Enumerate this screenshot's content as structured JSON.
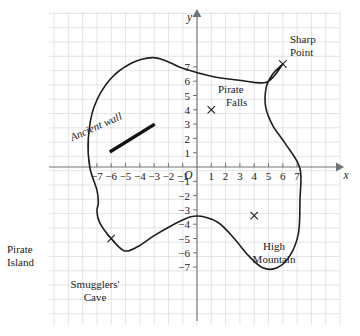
{
  "figure": {
    "kind": "coordinate-grid-map",
    "background_color": "#ffffff",
    "grid_color": "#d9dde2",
    "axis_color": "#6f7276",
    "ink_color": "#1d1d1d"
  },
  "axes": {
    "x_axis_label": "x",
    "y_axis_label": "y",
    "origin_label": "O",
    "x_ticks": [
      "−7",
      "−6",
      "−5",
      "−4",
      "−3",
      "−2",
      "−1",
      "1",
      "2",
      "3",
      "4",
      "5",
      "6",
      "7"
    ],
    "y_ticks": [
      "7",
      "6",
      "5",
      "4",
      "3",
      "2",
      "1",
      "−1",
      "−2",
      "−3",
      "−4",
      "−5",
      "−6",
      "−7"
    ],
    "x_range": [
      -8,
      8
    ],
    "y_range": [
      -8,
      8
    ],
    "grid_visible": true
  },
  "labels": {
    "island": {
      "line1": "Pirate",
      "line2": "Island"
    },
    "sharp_point": {
      "line1": "Sharp",
      "line2": "Point",
      "marker_coords": [
        6,
        7.2
      ]
    },
    "pirate_falls": {
      "line1": "Pirate",
      "line2": "Falls",
      "marker_coords": [
        1,
        4
      ]
    },
    "high_mountain": {
      "line1": "High",
      "line2": "Mountain",
      "marker_coords": [
        4,
        -3.4
      ]
    },
    "smugglers_cave": {
      "line1": "Smugglers'",
      "line2": "Cave",
      "marker_coords": [
        -6,
        -5
      ]
    },
    "ancient_wall": {
      "text": "Ancient wall",
      "segment_from": [
        -6.1,
        1.05
      ],
      "segment_to": [
        -2.95,
        3.0
      ]
    }
  },
  "chart_data": {
    "type": "line",
    "title": "",
    "xlabel": "x",
    "ylabel": "y",
    "xlim": [
      -8,
      8
    ],
    "ylim": [
      -8,
      8
    ],
    "grid": true,
    "legend": "none",
    "series": [
      {
        "name": "Island coastline",
        "closed": true,
        "points": [
          [
            6.0,
            7.2
          ],
          [
            4.9,
            5.95
          ],
          [
            3.1,
            6.05
          ],
          [
            1.0,
            6.35
          ],
          [
            -1.0,
            6.9
          ],
          [
            -2.0,
            7.35
          ],
          [
            -3.1,
            7.65
          ],
          [
            -4.6,
            7.25
          ],
          [
            -6.1,
            6.1
          ],
          [
            -7.2,
            4.2
          ],
          [
            -7.6,
            2.0
          ],
          [
            -7.5,
            0.0
          ],
          [
            -7.0,
            -1.6
          ],
          [
            -6.9,
            -2.5
          ],
          [
            -7.0,
            -3.1
          ],
          [
            -6.8,
            -3.9
          ],
          [
            -6.0,
            -5.0
          ],
          [
            -5.1,
            -5.85
          ],
          [
            -4.2,
            -5.6
          ],
          [
            -3.0,
            -4.8
          ],
          [
            -1.6,
            -4.0
          ],
          [
            -0.5,
            -3.5
          ],
          [
            0.3,
            -3.45
          ],
          [
            1.5,
            -3.9
          ],
          [
            2.6,
            -5.0
          ],
          [
            3.6,
            -6.2
          ],
          [
            4.6,
            -7.05
          ],
          [
            5.6,
            -7.05
          ],
          [
            6.5,
            -6.2
          ],
          [
            7.1,
            -4.6
          ],
          [
            7.2,
            -2.3
          ],
          [
            7.2,
            -0.1
          ],
          [
            6.2,
            1.6
          ],
          [
            5.3,
            2.9
          ],
          [
            4.8,
            4.2
          ],
          [
            4.85,
            5.6
          ],
          [
            5.3,
            6.5
          ],
          [
            6.0,
            7.2
          ]
        ]
      },
      {
        "name": "Ancient wall",
        "closed": false,
        "points": [
          [
            -6.1,
            1.05
          ],
          [
            -2.95,
            3.0
          ]
        ]
      }
    ],
    "annotations": [
      {
        "label": "Sharp Point",
        "x": 6,
        "y": 7.2,
        "marker": "x"
      },
      {
        "label": "Pirate Falls",
        "x": 1,
        "y": 4,
        "marker": "x"
      },
      {
        "label": "High Mountain",
        "x": 4,
        "y": -3.4,
        "marker": "x"
      },
      {
        "label": "Smugglers' Cave",
        "x": -6,
        "y": -5,
        "marker": "x"
      },
      {
        "label": "Pirate Island",
        "x": -9.5,
        "y": -5,
        "marker": "none"
      }
    ]
  }
}
